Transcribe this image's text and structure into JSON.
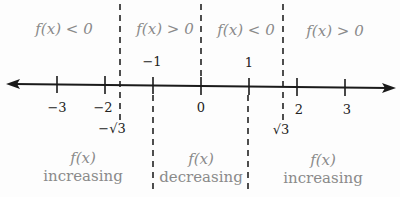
{
  "diagram": {
    "type": "sign-chart-number-line",
    "sign_regions": [
      {
        "label": "f(x) < 0",
        "interval": "(-inf, -sqrt3)"
      },
      {
        "label": "f(x) > 0",
        "interval": "(-sqrt3, 0)"
      },
      {
        "label": "f(x) < 0",
        "interval": "(0, sqrt3)"
      },
      {
        "label": "f(x) > 0",
        "interval": "(sqrt3, inf)"
      }
    ],
    "monotonic_regions": [
      {
        "line1": "f(x)",
        "line2": "increasing",
        "interval": "(-inf, -1)"
      },
      {
        "line1": "f(x)",
        "line2": "decreasing",
        "interval": "(-1, 1)"
      },
      {
        "line1": "f(x)",
        "line2": "increasing",
        "interval": "(1, inf)"
      }
    ],
    "ticks_below": [
      "−3",
      "−2",
      "0",
      "2",
      "3"
    ],
    "ticks_above": [
      "−1",
      "1"
    ],
    "special_points": [
      "−√3",
      "√3"
    ],
    "colors": {
      "axis": "#1a1a1a",
      "region_text": "#8a8a8a",
      "tick_text": "#222222",
      "background": "#fdfdfd"
    }
  }
}
